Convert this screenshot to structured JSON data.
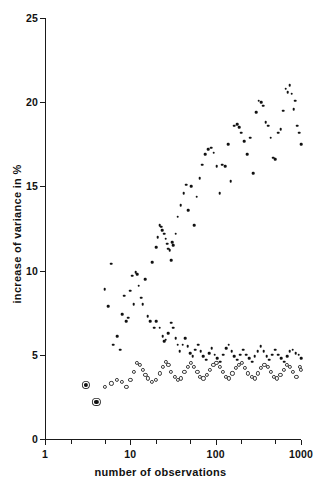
{
  "chart_data": {
    "type": "scatter",
    "title": "",
    "xlabel": "number of observations",
    "ylabel": "increase of variance in %",
    "xscale": "log",
    "yscale": "linear",
    "xlim": [
      1,
      1000
    ],
    "ylim": [
      0,
      25
    ],
    "grid": false,
    "legend": "none",
    "xticks": [
      1,
      10,
      100,
      1000
    ],
    "xtick_labels": [
      "1",
      "10",
      "100",
      "1000"
    ],
    "yticks": [
      0,
      5,
      10,
      15,
      20,
      25
    ],
    "ytick_labels": [
      "0",
      "5",
      "10",
      "15",
      "20",
      "25"
    ],
    "series": [
      {
        "name": "isolated-low-points",
        "marker": "filled-square-large",
        "points": [
          [
            3,
            3.2
          ],
          [
            4,
            2.2
          ]
        ]
      },
      {
        "name": "upper-branch",
        "marker": "filled-dot",
        "points": [
          [
            5,
            8.9
          ],
          [
            5.5,
            7.9
          ],
          [
            6,
            10.4
          ],
          [
            6.3,
            5.6
          ],
          [
            7,
            6.1
          ],
          [
            7.6,
            5.3
          ],
          [
            8,
            7.4
          ],
          [
            8.5,
            8.5
          ],
          [
            9,
            7.0
          ],
          [
            9.4,
            7.2
          ],
          [
            10,
            8.8
          ],
          [
            10.6,
            9.7
          ],
          [
            11,
            8.0
          ],
          [
            11.5,
            9.9
          ],
          [
            12,
            9.8
          ],
          [
            12.6,
            9.1
          ],
          [
            13.4,
            8.4
          ],
          [
            14,
            8.0
          ],
          [
            15,
            9.5
          ],
          [
            16,
            7.3
          ],
          [
            17,
            7.0
          ],
          [
            18,
            10.5
          ],
          [
            19,
            6.6
          ],
          [
            20,
            11.4
          ],
          [
            21,
            12.0
          ],
          [
            22,
            12.7
          ],
          [
            23,
            12.6
          ],
          [
            23.8,
            12.4
          ],
          [
            25,
            12.2
          ],
          [
            26,
            11.9
          ],
          [
            27,
            11.6
          ],
          [
            28,
            11.3
          ],
          [
            29,
            11.2
          ],
          [
            30,
            10.6
          ],
          [
            31,
            11.7
          ],
          [
            32,
            11.5
          ],
          [
            34,
            12.2
          ],
          [
            36,
            13.2
          ],
          [
            39,
            13.9
          ],
          [
            42,
            14.6
          ],
          [
            45,
            15.1
          ],
          [
            48,
            13.6
          ],
          [
            52,
            15.0
          ],
          [
            56,
            12.7
          ],
          [
            60,
            14.4
          ],
          [
            65,
            15.5
          ],
          [
            70,
            16.3
          ],
          [
            76,
            16.9
          ],
          [
            82,
            17.2
          ],
          [
            88,
            17.3
          ],
          [
            95,
            17.0
          ],
          [
            103,
            16.2
          ],
          [
            112,
            14.6
          ],
          [
            120,
            16.3
          ],
          [
            130,
            16.2
          ],
          [
            140,
            17.5
          ],
          [
            150,
            15.3
          ],
          [
            165,
            18.6
          ],
          [
            180,
            18.7
          ],
          [
            190,
            18.5
          ],
          [
            200,
            18.2
          ],
          [
            215,
            17.7
          ],
          [
            235,
            16.9
          ],
          [
            255,
            17.9
          ],
          [
            275,
            15.8
          ],
          [
            300,
            19.4
          ],
          [
            320,
            20.1
          ],
          [
            340,
            20.0
          ],
          [
            360,
            19.8
          ],
          [
            385,
            18.8
          ],
          [
            410,
            18.6
          ],
          [
            440,
            17.9
          ],
          [
            470,
            16.7
          ],
          [
            500,
            16.6
          ],
          [
            540,
            18.2
          ],
          [
            580,
            18.4
          ],
          [
            620,
            19.5
          ],
          [
            660,
            20.8
          ],
          [
            700,
            20.6
          ],
          [
            740,
            21.0
          ],
          [
            780,
            20.5
          ],
          [
            820,
            19.6
          ],
          [
            860,
            20.1
          ],
          [
            900,
            18.6
          ],
          [
            950,
            18.2
          ],
          [
            1000,
            17.5
          ]
        ]
      },
      {
        "name": "middle-branch",
        "marker": "filled-dot",
        "points": [
          [
            20,
            7.0
          ],
          [
            22,
            6.6
          ],
          [
            24,
            6.1
          ],
          [
            25,
            5.8
          ],
          [
            26,
            5.9
          ],
          [
            28,
            6.3
          ],
          [
            30,
            6.9
          ],
          [
            32,
            6.6
          ],
          [
            34,
            6.0
          ],
          [
            36,
            5.6
          ],
          [
            38,
            5.2
          ],
          [
            41,
            5.6
          ],
          [
            44,
            6.0
          ],
          [
            47,
            5.5
          ],
          [
            50,
            5.1
          ],
          [
            54,
            4.9
          ],
          [
            58,
            5.3
          ],
          [
            62,
            5.6
          ],
          [
            67,
            5.2
          ],
          [
            72,
            4.9
          ],
          [
            78,
            4.7
          ],
          [
            84,
            5.1
          ],
          [
            90,
            5.4
          ],
          [
            97,
            5.0
          ],
          [
            105,
            4.8
          ],
          [
            113,
            4.6
          ],
          [
            122,
            5.0
          ],
          [
            132,
            5.4
          ],
          [
            142,
            5.6
          ],
          [
            154,
            5.2
          ],
          [
            166,
            4.9
          ],
          [
            180,
            4.7
          ],
          [
            195,
            5.0
          ],
          [
            210,
            5.3
          ],
          [
            228,
            5.0
          ],
          [
            246,
            4.8
          ],
          [
            266,
            4.6
          ],
          [
            288,
            4.9
          ],
          [
            312,
            5.2
          ],
          [
            337,
            5.5
          ],
          [
            365,
            5.2
          ],
          [
            395,
            4.9
          ],
          [
            427,
            4.7
          ],
          [
            462,
            5.0
          ],
          [
            500,
            5.3
          ],
          [
            540,
            5.0
          ],
          [
            585,
            4.8
          ],
          [
            632,
            4.6
          ],
          [
            684,
            4.9
          ],
          [
            740,
            5.2
          ],
          [
            800,
            5.3
          ],
          [
            865,
            5.1
          ],
          [
            936,
            5.0
          ],
          [
            1000,
            4.8
          ]
        ]
      },
      {
        "name": "lower-branch",
        "marker": "open-dot",
        "points": [
          [
            5,
            3.1
          ],
          [
            6,
            3.3
          ],
          [
            7,
            3.5
          ],
          [
            8,
            3.4
          ],
          [
            9,
            3.1
          ],
          [
            10,
            3.5
          ],
          [
            11,
            4.0
          ],
          [
            12,
            4.5
          ],
          [
            13,
            4.4
          ],
          [
            14,
            4.1
          ],
          [
            15,
            3.8
          ],
          [
            16,
            3.6
          ],
          [
            18,
            3.4
          ],
          [
            20,
            3.5
          ],
          [
            22,
            3.9
          ],
          [
            24,
            4.3
          ],
          [
            26,
            4.6
          ],
          [
            28,
            4.4
          ],
          [
            30,
            4.0
          ],
          [
            33,
            3.7
          ],
          [
            36,
            3.5
          ],
          [
            39,
            3.6
          ],
          [
            43,
            4.0
          ],
          [
            47,
            4.3
          ],
          [
            51,
            4.5
          ],
          [
            56,
            4.3
          ],
          [
            61,
            4.0
          ],
          [
            66,
            3.7
          ],
          [
            72,
            3.6
          ],
          [
            79,
            3.8
          ],
          [
            86,
            4.1
          ],
          [
            94,
            4.4
          ],
          [
            102,
            4.5
          ],
          [
            111,
            4.3
          ],
          [
            121,
            4.0
          ],
          [
            132,
            3.7
          ],
          [
            144,
            3.6
          ],
          [
            157,
            3.9
          ],
          [
            171,
            4.2
          ],
          [
            186,
            4.4
          ],
          [
            203,
            4.5
          ],
          [
            221,
            4.2
          ],
          [
            241,
            3.9
          ],
          [
            263,
            3.7
          ],
          [
            287,
            3.6
          ],
          [
            313,
            3.9
          ],
          [
            341,
            4.2
          ],
          [
            372,
            4.4
          ],
          [
            405,
            4.3
          ],
          [
            442,
            4.0
          ],
          [
            482,
            3.7
          ],
          [
            525,
            3.6
          ],
          [
            573,
            3.8
          ],
          [
            625,
            4.1
          ],
          [
            681,
            4.4
          ],
          [
            743,
            4.3
          ],
          [
            810,
            4.0
          ],
          [
            883,
            3.7
          ],
          [
            963,
            4.3
          ],
          [
            1000,
            4.1
          ]
        ]
      }
    ]
  },
  "axes": {
    "x_title": "number of observations",
    "y_title": "increase of variance in %"
  }
}
